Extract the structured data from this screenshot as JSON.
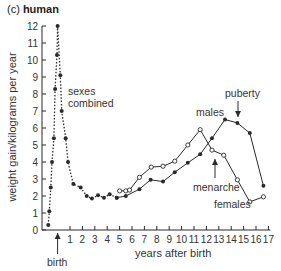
{
  "chart_data": {
    "type": "line",
    "title": "(c) human",
    "title_prefix": "(c)",
    "title_main": "human",
    "xlabel": "years after birth",
    "ylabel": "weight gain/kilograms per year",
    "xlim": [
      -1,
      17
    ],
    "ylim": [
      0,
      12
    ],
    "xticks": [
      1,
      2,
      3,
      4,
      5,
      6,
      7,
      8,
      9,
      10,
      11,
      12,
      13,
      14,
      15,
      16,
      17
    ],
    "yticks": [
      0,
      1,
      2,
      3,
      4,
      5,
      6,
      7,
      8,
      9,
      10,
      11,
      12
    ],
    "grid": false,
    "series": [
      {
        "name": "sexes combined",
        "style": "dotted",
        "marker": "filled",
        "x": [
          -0.75,
          -0.67,
          -0.55,
          -0.45,
          -0.3,
          -0.2,
          -0.05,
          0.0,
          0.22,
          0.33,
          0.65,
          0.84,
          1.27,
          1.86,
          2.35,
          2.77,
          3.26,
          3.74,
          4.2,
          4.77
        ],
        "y": [
          0.3,
          1.1,
          2.5,
          4.0,
          5.4,
          8.3,
          10.3,
          12.0,
          9.1,
          7.0,
          5.4,
          4.0,
          2.7,
          2.5,
          2.0,
          1.85,
          2.05,
          1.9,
          2.1,
          1.9
        ]
      },
      {
        "name": "males",
        "style": "solid",
        "marker": "filled",
        "x": [
          4.77,
          5.5,
          6.6,
          7.5,
          8.5,
          9.45,
          10.5,
          11.5,
          12.45,
          13.5,
          14.5,
          15.5,
          16.6
        ],
        "y": [
          1.9,
          2.0,
          2.4,
          2.95,
          2.85,
          3.4,
          3.95,
          4.45,
          5.4,
          6.5,
          6.3,
          5.7,
          2.6
        ]
      },
      {
        "name": "females",
        "style": "solid",
        "marker": "open",
        "x": [
          5.0,
          5.5,
          5.8,
          6.6,
          7.55,
          8.5,
          9.45,
          10.5,
          11.5,
          12.45,
          13.4,
          14.5,
          15.5,
          16.6
        ],
        "y": [
          2.3,
          2.3,
          2.35,
          3.1,
          3.7,
          3.75,
          4.05,
          5.0,
          5.9,
          4.7,
          4.4,
          2.95,
          1.65,
          1.95
        ]
      }
    ],
    "annotations": [
      {
        "text": "sexes combined",
        "x": 1.0,
        "y": 8.3
      },
      {
        "text": "males",
        "x": 10.9,
        "y": 6.9
      },
      {
        "text": "puberty",
        "x": 13.7,
        "y": 7.9,
        "arrow_to": [
          14.2,
          6.7
        ]
      },
      {
        "text": "menarche",
        "x": 11.6,
        "y": 2.5,
        "arrow_to": [
          12.6,
          4.7
        ]
      },
      {
        "text": "females",
        "x": 13.4,
        "y": 1.3
      },
      {
        "text": "birth",
        "x": -0.5,
        "y": -1.8,
        "arrow_to": [
          0,
          -0.1
        ]
      }
    ]
  },
  "labels": {
    "sexes_combined_line1": "sexes",
    "sexes_combined_line2": "combined",
    "males": "males",
    "puberty": "puberty",
    "menarche": "menarche",
    "females": "females",
    "birth": "birth"
  },
  "colors": {
    "line": "#2a2a2a",
    "text": "#333333",
    "background": "#ffffff"
  }
}
